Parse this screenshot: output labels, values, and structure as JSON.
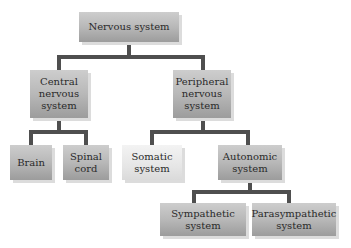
{
  "diagram": {
    "type": "hierarchy",
    "nodes": {
      "root": "Nervous system",
      "cns": "Central\nnervous\nsystem",
      "pns": "Peripheral\nnervous\nsystem",
      "brain": "Brain",
      "spinal_cord": "Spinal\ncord",
      "somatic": "Somatic\nsystem",
      "autonomic": "Autonomic\nsystem",
      "sympathetic": "Sympathetic\nsystem",
      "parasympathetic": "Parasympathetic\nsystem"
    },
    "edges": [
      [
        "Nervous system",
        "Central nervous system"
      ],
      [
        "Nervous system",
        "Peripheral nervous system"
      ],
      [
        "Central nervous system",
        "Brain"
      ],
      [
        "Central nervous system",
        "Spinal cord"
      ],
      [
        "Peripheral nervous system",
        "Somatic system"
      ],
      [
        "Peripheral nervous system",
        "Autonomic system"
      ],
      [
        "Autonomic system",
        "Sympathetic system"
      ],
      [
        "Autonomic system",
        "Parasympathetic system"
      ]
    ],
    "colors": {
      "box_top": "#cdcdcd",
      "box_bottom": "#9c9c9c",
      "connector": "#4f4f4f",
      "light_box": "#ececec"
    }
  }
}
